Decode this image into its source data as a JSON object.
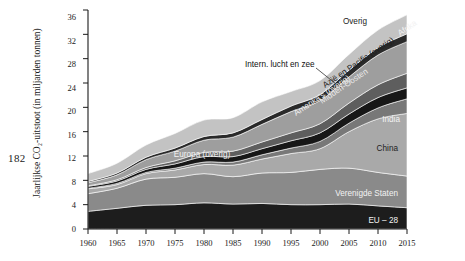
{
  "page": {
    "number": "182"
  },
  "chart_data": {
    "type": "area",
    "stacked": true,
    "title": "",
    "xlabel": "",
    "ylabel": "Jaarlijkse CO₂-uitstoot (in miljarden tonnen)",
    "xlim": [
      1960,
      2015
    ],
    "ylim": [
      0,
      36
    ],
    "grid": false,
    "legend_position": "inline-labels",
    "x": [
      1960,
      1965,
      1970,
      1975,
      1980,
      1985,
      1990,
      1995,
      2000,
      2005,
      2010,
      2015
    ],
    "xticks": [
      "1960",
      "1965",
      "1970",
      "1975",
      "1980",
      "1985",
      "1990",
      "1995",
      "2000",
      "2005",
      "2010",
      "2015"
    ],
    "yticks": [
      "0",
      "4",
      "8",
      "12",
      "16",
      "20",
      "24",
      "28",
      "32",
      "36"
    ],
    "series": [
      {
        "name": "EU – 28",
        "color": "#1d1d1d",
        "values": [
          2.9,
          3.4,
          3.9,
          4.0,
          4.3,
          4.1,
          4.2,
          4.0,
          4.0,
          4.1,
          3.8,
          3.5
        ]
      },
      {
        "name": "Verenigde Staten",
        "color": "#8a8a8a",
        "values": [
          2.9,
          3.3,
          4.3,
          4.5,
          4.8,
          4.5,
          5.0,
          5.3,
          5.8,
          5.9,
          5.5,
          5.2
        ]
      },
      {
        "name": "China",
        "color": "#a9a9a9",
        "values": [
          0.8,
          0.6,
          0.9,
          1.2,
          1.5,
          1.9,
          2.3,
          3.1,
          3.4,
          6.0,
          8.8,
          10.3
        ]
      },
      {
        "name": "India",
        "color": "#787878",
        "values": [
          0.1,
          0.2,
          0.2,
          0.3,
          0.4,
          0.5,
          0.7,
          0.9,
          1.2,
          1.4,
          1.8,
          2.4
        ]
      },
      {
        "name": "Amerika's (overig)",
        "color": "#171717",
        "values": [
          0.3,
          0.4,
          0.5,
          0.7,
          0.9,
          0.9,
          1.0,
          1.2,
          1.4,
          1.5,
          1.7,
          1.8
        ]
      },
      {
        "name": "Midden-Oosten",
        "color": "#5e5e5e",
        "values": [
          0.1,
          0.2,
          0.3,
          0.5,
          0.7,
          0.9,
          1.1,
          1.3,
          1.5,
          1.8,
          2.1,
          2.4
        ]
      },
      {
        "name": "Azië en Pacific (overig)",
        "color": "#9e9e9e",
        "values": [
          0.5,
          0.8,
          1.3,
          1.6,
          2.0,
          2.3,
          2.9,
          3.5,
          3.8,
          4.3,
          4.9,
          5.2
        ]
      },
      {
        "name": "Afrika",
        "color": "#2a2a2a",
        "values": [
          0.2,
          0.3,
          0.4,
          0.5,
          0.6,
          0.7,
          0.8,
          0.9,
          1.0,
          1.1,
          1.2,
          1.3
        ]
      },
      {
        "name": "Overig",
        "color": "#c3c3c3",
        "values": [
          1.3,
          1.6,
          2.0,
          2.4,
          2.7,
          2.5,
          2.9,
          2.4,
          2.3,
          2.6,
          2.9,
          3.1
        ]
      }
    ],
    "annotations": [
      {
        "text": "Intern. lucht en zee",
        "note": "leader line to upper band"
      }
    ]
  },
  "labels": {
    "eu28": "EU – 28",
    "usa": "Verenigde Staten",
    "china": "China",
    "india": "India",
    "americas_other": "Amerika's (overig)",
    "middle_east": "Midden-Oosten",
    "asia_pacific_other": "Azië en Pacific (overig)",
    "africa": "Afrika",
    "other": "Overig",
    "europe_other": "Europa (overig)",
    "intl_air_sea": "Intern. lucht en zee"
  }
}
